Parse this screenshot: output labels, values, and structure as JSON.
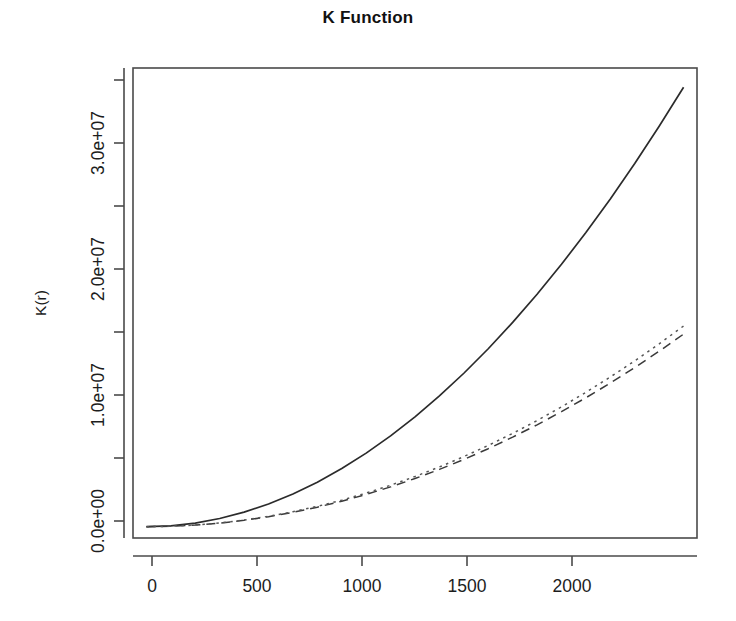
{
  "figure": {
    "title": "K Function",
    "background_color": "#ffffff",
    "foreground_color": "#1a1a1a"
  },
  "axes": {
    "x": {
      "label": "",
      "ticks": [
        0,
        500,
        1000,
        1500,
        2000
      ],
      "tick_labels": [
        "0",
        "500",
        "1000",
        "1500",
        "2000"
      ],
      "range": [
        -55,
        2255
      ],
      "minor_ticks": []
    },
    "y": {
      "label": "K(r)",
      "ticks": [
        0,
        10000000,
        20000000,
        30000000
      ],
      "tick_labels": [
        "0.0e+00",
        "1.0e+07",
        "2.0e+07",
        "3.0e+07"
      ],
      "range": [
        -900000,
        36500000
      ],
      "minor_ticks": [
        5000000,
        15000000,
        25000000,
        35000000
      ]
    }
  },
  "chart_data": {
    "type": "line",
    "title": "K Function",
    "xlabel": "",
    "ylabel": "K(r)",
    "xlim": [
      -55,
      2255
    ],
    "ylim": [
      -900000,
      36500000
    ],
    "grid": false,
    "legend": "none",
    "x": [
      0,
      100,
      200,
      300,
      400,
      500,
      600,
      700,
      800,
      900,
      1000,
      1100,
      1200,
      1300,
      1400,
      1500,
      1600,
      1700,
      1800,
      1900,
      2000,
      2100,
      2200
    ],
    "series": [
      {
        "name": "Kobs",
        "style": "solid",
        "color": "#2b2b2b",
        "values": [
          0,
          72000,
          289000,
          650000,
          1156000,
          1806000,
          2601000,
          3540000,
          4624000,
          5852000,
          7225000,
          8742000,
          10404000,
          12210000,
          14161000,
          16256000,
          18496000,
          20880000,
          23409000,
          26082000,
          28900000,
          31862000,
          34969000
        ]
      },
      {
        "name": "Ktheo-dashed",
        "style": "dashed",
        "color": "#3a3a3a",
        "values": [
          0,
          31000,
          126000,
          285000,
          507000,
          792000,
          1140000,
          1552000,
          2027000,
          2565000,
          3167000,
          3832000,
          4560000,
          5352000,
          6207000,
          7125000,
          8107000,
          9152000,
          10260000,
          11431000,
          12666000,
          13964000,
          15325000
        ]
      },
      {
        "name": "Ktheo-dotted",
        "style": "dotted",
        "color": "#565656",
        "values": [
          0,
          33000,
          132000,
          297000,
          528000,
          825000,
          1188000,
          1617000,
          2112000,
          2673000,
          3300000,
          3993000,
          4752000,
          5577000,
          6468000,
          7425000,
          8448000,
          9537000,
          10692000,
          11913000,
          13200000,
          14553000,
          15972000
        ]
      }
    ]
  },
  "plot_box": {
    "left": 133,
    "top": 68,
    "right": 697,
    "bottom": 538,
    "border_color": "#4a4a4a"
  }
}
